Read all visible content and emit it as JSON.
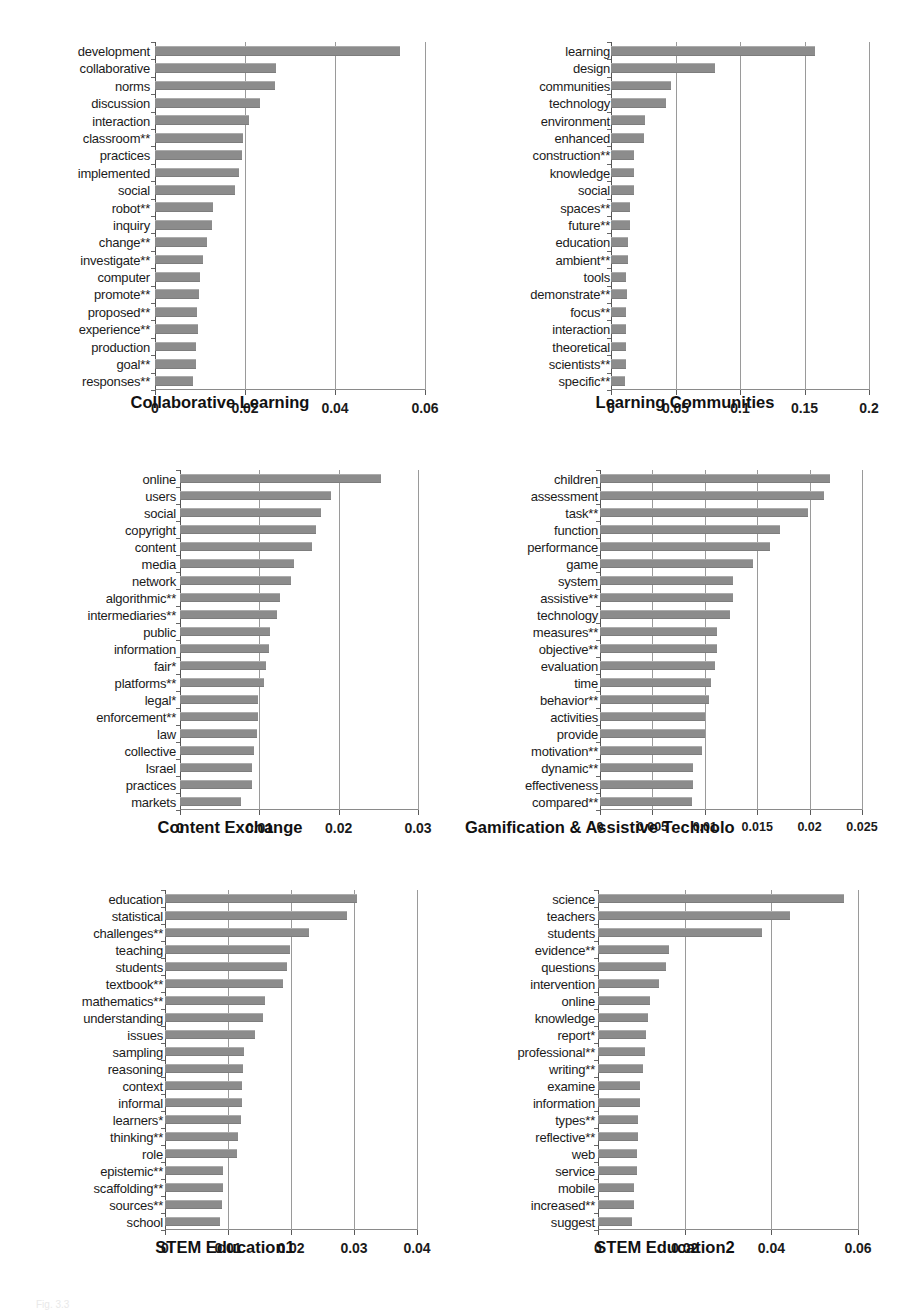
{
  "figure": {
    "caption": "Fig. 3.3",
    "bar_color": "#8c8c8c",
    "background": "#ffffff"
  },
  "chart_data": [
    {
      "id": "collaborative-learning",
      "type": "bar",
      "orientation": "horizontal",
      "title": "Collaborative Learning",
      "xlabel": "Collaborative Learning",
      "ylabel": "",
      "xlim": [
        0,
        0.06
      ],
      "xticks": [
        0,
        0.02,
        0.04,
        0.06
      ],
      "xticklabels": [
        "0",
        "0.02",
        "0.04",
        "0.06"
      ],
      "grid": true,
      "categories": [
        "development",
        "collaborative",
        "norms",
        "discussion",
        "interaction",
        "classroom**",
        "practices",
        "implemented",
        "social",
        "robot**",
        "inquiry",
        "change**",
        "investigate**",
        "computer",
        "promote**",
        "proposed**",
        "experience**",
        "production",
        "goal**",
        "responses**"
      ],
      "values": [
        0.0545,
        0.0268,
        0.0266,
        0.0233,
        0.0209,
        0.0196,
        0.0194,
        0.0186,
        0.0177,
        0.0128,
        0.0126,
        0.0115,
        0.0107,
        0.0099,
        0.0098,
        0.0094,
        0.0096,
        0.009,
        0.009,
        0.0085
      ]
    },
    {
      "id": "learning-communities",
      "type": "bar",
      "orientation": "horizontal",
      "title": "Learning Communities",
      "xlabel": "Learning Communities",
      "ylabel": "",
      "xlim": [
        0,
        0.2
      ],
      "xticks": [
        0,
        0.05,
        0.1,
        0.15,
        0.2
      ],
      "xticklabels": [
        "0",
        "0.05",
        "0.1",
        "0.15",
        "0.2"
      ],
      "grid": true,
      "categories": [
        "learning",
        "design",
        "communities",
        "technology",
        "environment",
        "enhanced",
        "construction**",
        "knowledge",
        "social",
        "spaces**",
        "future**",
        "education",
        "ambient**",
        "tools",
        "demonstrate**",
        "focus**",
        "interaction",
        "theoretical",
        "scientists**",
        "specific**"
      ],
      "values": [
        0.1585,
        0.0805,
        0.0465,
        0.0425,
        0.0262,
        0.0255,
        0.018,
        0.0178,
        0.0175,
        0.015,
        0.0148,
        0.013,
        0.0128,
        0.0118,
        0.0125,
        0.012,
        0.0118,
        0.0118,
        0.0115,
        0.011
      ]
    },
    {
      "id": "content-exchange",
      "type": "bar",
      "orientation": "horizontal",
      "title": "Content Exchange",
      "xlabel": "Content Exchange",
      "ylabel": "",
      "xlim": [
        0,
        0.03
      ],
      "xticks": [
        0,
        0.01,
        0.02,
        0.03
      ],
      "xticklabels": [
        "0",
        "0.01",
        "0.02",
        "0.03"
      ],
      "grid": true,
      "categories": [
        "online",
        "users",
        "social",
        "copyright",
        "content",
        "media",
        "network",
        "algorithmic**",
        "intermediaries**",
        "public",
        "information",
        "fair*",
        "platforms**",
        "legal*",
        "enforcement**",
        "law",
        "collective",
        "Israel",
        "practices",
        "markets"
      ],
      "values": [
        0.0253,
        0.019,
        0.0178,
        0.0172,
        0.0166,
        0.0144,
        0.014,
        0.0126,
        0.0122,
        0.0114,
        0.0112,
        0.0108,
        0.0106,
        0.0098,
        0.0098,
        0.0097,
        0.0093,
        0.0091,
        0.0091,
        0.0077
      ]
    },
    {
      "id": "gamification-assistive-technology",
      "type": "bar",
      "orientation": "horizontal",
      "title": "Gamification & Assistive Technolo",
      "xlabel": "Gamification & Assistive Technolo",
      "ylabel": "",
      "xlim": [
        0,
        0.025
      ],
      "xticks": [
        0,
        0.005,
        0.01,
        0.015,
        0.02,
        0.025
      ],
      "xticklabels": [
        "0",
        "0.005",
        "0.01",
        "0.015",
        "0.02",
        "0.025"
      ],
      "grid": true,
      "categories": [
        "children",
        "assessment",
        "task**",
        "function",
        "performance",
        "game",
        "system",
        "assistive**",
        "technology",
        "measures**",
        "objective**",
        "evaluation",
        "time",
        "behavior**",
        "activities",
        "provide",
        "motivation**",
        "dynamic**",
        "effectiveness",
        "compared**"
      ],
      "values": [
        0.0219,
        0.0214,
        0.0198,
        0.0172,
        0.0162,
        0.0146,
        0.0127,
        0.0127,
        0.0124,
        0.0112,
        0.0112,
        0.011,
        0.0106,
        0.0104,
        0.01,
        0.01,
        0.0097,
        0.0089,
        0.0089,
        0.0088
      ]
    },
    {
      "id": "stem-education-1",
      "type": "bar",
      "orientation": "horizontal",
      "title": "STEM Education1",
      "xlabel": "STEM Education1",
      "ylabel": "",
      "xlim": [
        0,
        0.04
      ],
      "xticks": [
        0,
        0.01,
        0.02,
        0.03,
        0.04
      ],
      "xticklabels": [
        "0",
        "0.01",
        "0.02",
        "0.03",
        "0.04"
      ],
      "grid": true,
      "categories": [
        "education",
        "statistical",
        "challenges**",
        "teaching",
        "students",
        "textbook**",
        "mathematics**",
        "understanding",
        "issues",
        "sampling",
        "reasoning",
        "context",
        "informal",
        "learners*",
        "thinking**",
        "role",
        "epistemic**",
        "scaffolding**",
        "sources**",
        "school"
      ],
      "values": [
        0.0305,
        0.0289,
        0.0228,
        0.0199,
        0.0193,
        0.0187,
        0.0158,
        0.0155,
        0.0143,
        0.0125,
        0.0124,
        0.0122,
        0.0122,
        0.012,
        0.0116,
        0.0115,
        0.0092,
        0.0092,
        0.0091,
        0.0088
      ]
    },
    {
      "id": "stem-education-2",
      "type": "bar",
      "orientation": "horizontal",
      "title": "STEM Education2",
      "xlabel": "STEM Education2",
      "ylabel": "",
      "xlim": [
        0,
        0.06
      ],
      "xticks": [
        0,
        0.02,
        0.04,
        0.06
      ],
      "xticklabels": [
        "0",
        "0.02",
        "0.04",
        "0.06"
      ],
      "grid": true,
      "categories": [
        "science",
        "teachers",
        "students",
        "evidence**",
        "questions",
        "intervention",
        "online",
        "knowledge",
        "report*",
        "professional**",
        "writing**",
        "examine",
        "information",
        "types**",
        "reflective**",
        "web",
        "service",
        "mobile",
        "increased**",
        "suggest"
      ],
      "values": [
        0.0568,
        0.0443,
        0.0378,
        0.0164,
        0.0158,
        0.0141,
        0.0119,
        0.0115,
        0.011,
        0.0109,
        0.0103,
        0.0098,
        0.0098,
        0.0093,
        0.0093,
        0.0089,
        0.0089,
        0.0084,
        0.0084,
        0.0079
      ]
    }
  ],
  "panels": [
    {
      "left": 10,
      "top": 30,
      "labels_width": 140,
      "plot_left": 155,
      "plot_width": 270,
      "plot_top": 12,
      "plot_height": 348,
      "title_left": 10,
      "title_top": 393,
      "title_width": 420,
      "clip": false
    },
    {
      "left": 470,
      "top": 30,
      "labels_width": 140,
      "plot_left": 611,
      "plot_width": 258,
      "plot_top": 12,
      "plot_height": 348,
      "title_left": 470,
      "title_top": 393,
      "title_width": 430,
      "clip": false
    },
    {
      "left": 30,
      "top": 458,
      "labels_width": 146,
      "plot_left": 180,
      "plot_width": 238,
      "plot_top": 12,
      "plot_height": 340,
      "title_left": 30,
      "title_top": 818,
      "title_width": 400,
      "clip": false
    },
    {
      "left": 455,
      "top": 458,
      "labels_width": 143,
      "plot_left": 600,
      "plot_width": 262,
      "plot_top": 12,
      "plot_height": 340,
      "title_left": 455,
      "title_top": 818,
      "title_width": 464,
      "clip": true
    },
    {
      "left": 20,
      "top": 878,
      "labels_width": 143,
      "plot_left": 165,
      "plot_width": 252,
      "plot_top": 12,
      "plot_height": 340,
      "title_left": 20,
      "title_top": 1238,
      "title_width": 410,
      "clip": false
    },
    {
      "left": 455,
      "top": 878,
      "labels_width": 140,
      "plot_left": 598,
      "plot_width": 260,
      "plot_top": 12,
      "plot_height": 340,
      "title_left": 455,
      "title_top": 1238,
      "title_width": 420,
      "clip": false
    }
  ]
}
